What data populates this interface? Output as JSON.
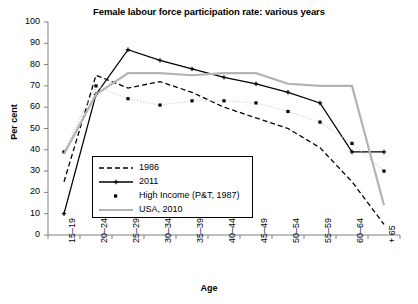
{
  "chart_data": {
    "type": "line",
    "title": "Female labour force participation rate: various years",
    "xlabel": "Age",
    "ylabel": "Per cent",
    "ylim": [
      0,
      100
    ],
    "ytick_step": 10,
    "yticks": [
      0,
      10,
      20,
      30,
      40,
      50,
      60,
      70,
      80,
      90,
      100
    ],
    "grid": false,
    "legend_position": "inside lower-left",
    "categories": [
      "15–19",
      "20–24",
      "25–29",
      "30–34",
      "35–39",
      "40–44",
      "45–49",
      "50–54",
      "55–59",
      "60–64",
      "+ 65"
    ],
    "series": [
      {
        "name": "1986",
        "style": "dashed",
        "color": "#000000",
        "marker": "none",
        "values": [
          25,
          75,
          69,
          72,
          67,
          60,
          55,
          50,
          41,
          25,
          5
        ]
      },
      {
        "name": "2011",
        "style": "solid",
        "color": "#000000",
        "marker": "plus",
        "values": [
          10,
          66,
          87,
          82,
          78,
          74,
          71,
          67,
          62,
          39,
          39
        ]
      },
      {
        "name": "High Income (P&T, 1987)",
        "style": "dotted",
        "color": "#cccccc",
        "marker": "square",
        "values": [
          39,
          70,
          64,
          61,
          63,
          63,
          62,
          58,
          53,
          43,
          30
        ]
      },
      {
        "name": "USA, 2010",
        "style": "solid",
        "color": "#b3b3b3",
        "marker": "none",
        "values": [
          38,
          66,
          76,
          76,
          75,
          76,
          76,
          71,
          70,
          70,
          14
        ]
      }
    ]
  },
  "legend": {
    "items": [
      {
        "label": "1986"
      },
      {
        "label": "2011"
      },
      {
        "label": "High Income (P&T, 1987)"
      },
      {
        "label": "USA, 2010"
      }
    ]
  }
}
